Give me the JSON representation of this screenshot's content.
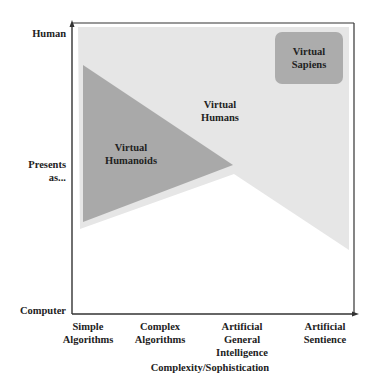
{
  "diagram": {
    "y_axis": {
      "top_label": "Human",
      "middle_label_line1": "Presents",
      "middle_label_line2": "as...",
      "bottom_label": "Computer"
    },
    "x_axis": {
      "title": "Complexity/Sophistication",
      "ticks": [
        {
          "line1": "Simple",
          "line2": "Algorithms",
          "line3": ""
        },
        {
          "line1": "Complex",
          "line2": "Algorithms",
          "line3": ""
        },
        {
          "line1": "Artificial",
          "line2": "General",
          "line3": "Intelligence"
        },
        {
          "line1": "Artificial",
          "line2": "Sentience",
          "line3": ""
        }
      ]
    },
    "regions": [
      {
        "name": "Virtual Humans",
        "line1": "Virtual",
        "line2": "Humans",
        "color": "#e6e6e6"
      },
      {
        "name": "Virtual Humanoids",
        "line1": "Virtual",
        "line2": "Humanoids",
        "color": "#a9a9a9"
      },
      {
        "name": "Virtual Sapiens",
        "line1": "Virtual",
        "line2": "Sapiens",
        "color": "#acacac"
      }
    ],
    "colors": {
      "axis": "#333333",
      "light_region": "#e6e6e6",
      "dark_region": "#a9a9a9",
      "sapiens_box": "#acacac"
    }
  }
}
